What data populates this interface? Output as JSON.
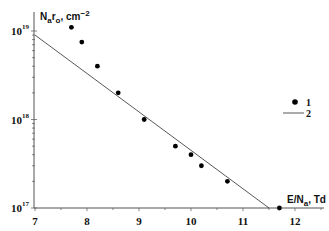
{
  "chart_data": {
    "type": "scatter",
    "title": "",
    "xlabel": "E/N_a, Td",
    "ylabel": "N_a r_o, cm^-2",
    "xlim": [
      7,
      12.5
    ],
    "ylim": [
      1e+17,
      1.3e+19
    ],
    "yscale": "log",
    "grid": false,
    "legend_position": "right-middle",
    "x_ticks": [
      "7",
      "8",
      "9",
      "10",
      "11",
      "12"
    ],
    "y_ticks": [
      "10^17",
      "10^18",
      "10^19"
    ],
    "series": [
      {
        "name": "1",
        "kind": "points",
        "x": [
          7.7,
          7.9,
          8.2,
          8.6,
          9.1,
          9.7,
          10.0,
          10.2,
          10.7,
          11.7
        ],
        "y": [
          1.1e+19,
          7.5e+18,
          4e+18,
          2e+18,
          1e+18,
          5e+17,
          4e+17,
          3e+17,
          2e+17,
          1e+17
        ]
      },
      {
        "name": "2",
        "kind": "line",
        "x": [
          7.0,
          11.5
        ],
        "y": [
          9e+18,
          1e+17
        ]
      }
    ]
  },
  "labels": {
    "y_axis_main": "N",
    "y_axis_sub1": "a",
    "y_axis_mid": "r",
    "y_axis_sub2": "o",
    "y_axis_unit": ", cm",
    "y_axis_exp": "−2",
    "x_axis_main": "E/N",
    "x_axis_sub": "a",
    "x_axis_unit": ", Td",
    "y_tick_base": "10",
    "y_tick_exps": [
      "19",
      "18",
      "17"
    ],
    "legend": [
      "1",
      "2"
    ]
  }
}
